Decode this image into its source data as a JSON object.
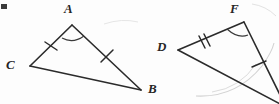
{
  "figure": {
    "background_color": "#fdfdfd",
    "stroke_color": "#2b2b2b",
    "faint_stroke_color": "#c8c8c8",
    "label_color": "#262626"
  },
  "triangles": [
    {
      "name": "triangle-abc",
      "vertices": [
        {
          "id": "A",
          "label": "A",
          "x": 72,
          "y": 25,
          "label_x": 64,
          "label_y": 2
        },
        {
          "id": "C",
          "label": "C",
          "x": 30,
          "y": 66,
          "label_x": 6,
          "label_y": 58
        },
        {
          "id": "B",
          "label": "B",
          "x": 141,
          "y": 90,
          "label_x": 148,
          "label_y": 82
        }
      ],
      "sides": [
        {
          "from": "C",
          "to": "A",
          "ticks": 1,
          "tick_name": "tick-side-ca"
        },
        {
          "from": "A",
          "to": "B",
          "ticks": 1,
          "tick_name": "tick-side-ab"
        },
        {
          "from": "C",
          "to": "B",
          "ticks": 0,
          "tick_name": ""
        }
      ],
      "angle_marks": [
        {
          "at": "A",
          "arcs": 1,
          "name": "angle-arc-a"
        }
      ]
    },
    {
      "name": "triangle-def",
      "vertices": [
        {
          "id": "F",
          "label": "F",
          "x": 244,
          "y": 22,
          "label_x": 230,
          "label_y": 2
        },
        {
          "id": "D",
          "label": "D",
          "x": 178,
          "y": 50,
          "label_x": 157,
          "label_y": 40
        },
        {
          "id": "E",
          "label": "",
          "x": 286,
          "y": 107,
          "label_x": 0,
          "label_y": 0
        }
      ],
      "sides": [
        {
          "from": "D",
          "to": "F",
          "ticks": 2,
          "tick_name": "tick-side-df"
        },
        {
          "from": "F",
          "to": "E",
          "ticks": 1,
          "tick_name": "tick-side-fe"
        },
        {
          "from": "D",
          "to": "E",
          "ticks": 0,
          "tick_name": ""
        }
      ],
      "angle_marks": [
        {
          "at": "F",
          "arcs": 1,
          "name": "angle-arc-f"
        }
      ]
    }
  ],
  "faint_marks": [
    {
      "name": "faint-arc-right",
      "description": "light gray arc near right triangle interior"
    },
    {
      "name": "faint-arc-left",
      "description": "light gray smudge near left of figure"
    }
  ],
  "artifacts": [
    {
      "name": "corner-speck",
      "x": 1,
      "y": 4,
      "w": 6,
      "h": 5
    }
  ]
}
